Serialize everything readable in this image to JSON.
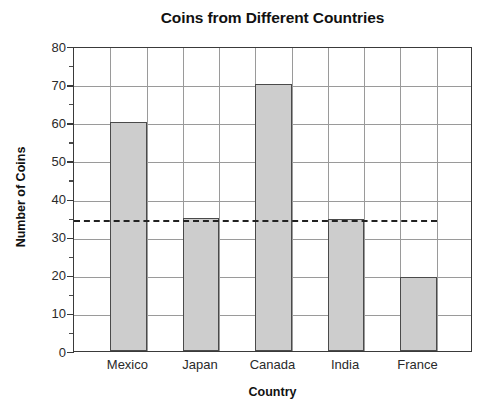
{
  "chart_data": {
    "type": "bar",
    "title": "Coins from Different Countries",
    "xlabel": "Country",
    "ylabel": "Number of Coins",
    "categories": [
      "Mexico",
      "Japan",
      "Canada",
      "India",
      "France"
    ],
    "values": [
      60,
      35,
      70,
      34.5,
      19.5
    ],
    "ylim": [
      0,
      80
    ],
    "ytick_major": [
      0,
      10,
      20,
      30,
      40,
      50,
      60,
      70,
      80
    ],
    "ytick_major_labels": [
      "0",
      "10",
      "20",
      "30",
      "40",
      "50",
      "60",
      "70",
      "80"
    ],
    "ytick_minor": [
      5,
      15,
      25,
      35,
      45,
      55,
      65,
      75
    ],
    "grid": "both",
    "legend": "none",
    "annotations": [
      {
        "name": "reference-line",
        "type": "horizontal-dashed-line",
        "value": 35,
        "style": "dashed",
        "color": "#222222",
        "extent": "from y-axis across Mexico, Japan, Canada and India bars"
      }
    ],
    "colors": {
      "bar_fill": "#cdcdcd",
      "bar_stroke": "#4a4a4a",
      "grid": "#9a9a9a",
      "axis": "#3a3a3a",
      "text": "#111111",
      "background": "#ffffff"
    }
  }
}
